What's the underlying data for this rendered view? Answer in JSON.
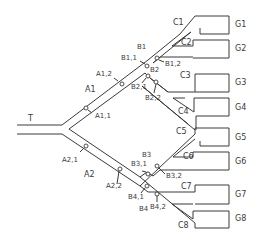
{
  "diagram": {
    "colors": {
      "stroke": "#3a3a3a",
      "background": "#ffffff"
    },
    "trunk": {
      "label": "T"
    },
    "level_a": [
      {
        "label": "A1",
        "probes": [
          "A1,1",
          "A1,2"
        ]
      },
      {
        "label": "A2",
        "probes": [
          "A2,1",
          "A2,2"
        ]
      }
    ],
    "level_b": [
      {
        "label": "B1",
        "probes": [
          "B1,1",
          "B1,2"
        ]
      },
      {
        "label": "B2",
        "probes": [
          "B2,1",
          "B2,2"
        ]
      },
      {
        "label": "B3",
        "probes": [
          "B3,1",
          "B3,2"
        ]
      },
      {
        "label": "B4",
        "probes": [
          "B4,1",
          "B4,2"
        ]
      }
    ],
    "level_c": [
      "C1",
      "C2",
      "C3",
      "C4",
      "C5",
      "C6",
      "C7",
      "C8"
    ],
    "terminals": [
      "G1",
      "G2",
      "G3",
      "G4",
      "G5",
      "G6",
      "G7",
      "G8"
    ]
  }
}
